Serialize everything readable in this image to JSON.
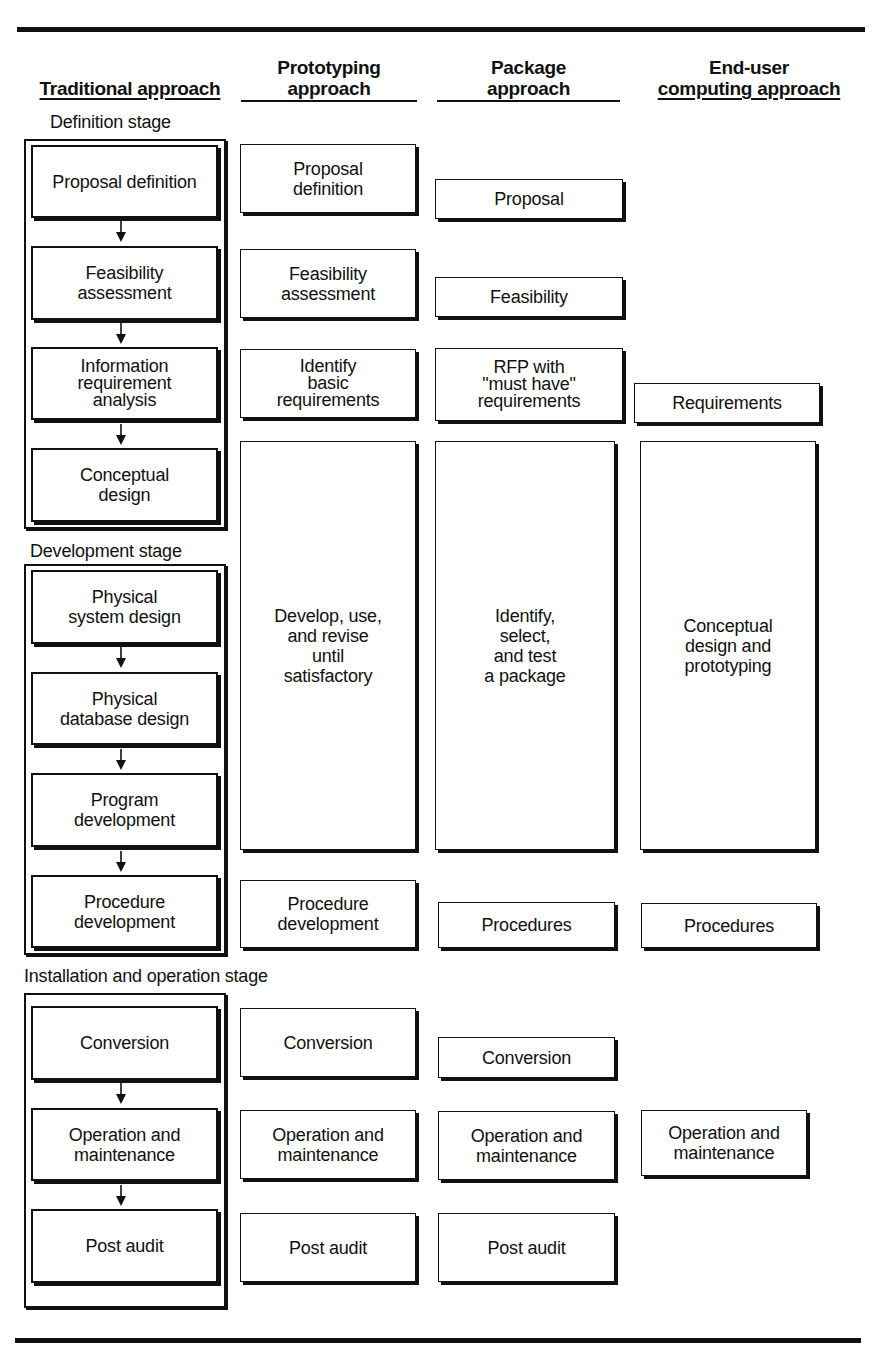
{
  "headers": {
    "traditional": {
      "line1": "",
      "line2": "Traditional approach"
    },
    "prototyping": {
      "line1": "Prototyping",
      "line2": "approach"
    },
    "package": {
      "line1": "Package",
      "line2": "approach"
    },
    "end_user": {
      "line1": "End-user",
      "line2": "computing approach"
    }
  },
  "stages": {
    "definition": "Definition stage",
    "development": "Development stage",
    "installation": "Installation and operation stage"
  },
  "traditional": [
    "Proposal definition",
    "Feasibility\nassessment",
    "Information\nrequirement\nanalysis",
    "Conceptual\ndesign",
    "Physical\nsystem design",
    "Physical\ndatabase design",
    "Program\ndevelopment",
    "Procedure\ndevelopment",
    "Conversion",
    "Operation and\nmaintenance",
    "Post audit"
  ],
  "prototyping": [
    "Proposal\ndefinition",
    "Feasibility\nassessment",
    "Identify\nbasic\nrequirements",
    "Develop, use,\nand revise\nuntil\nsatisfactory",
    "Procedure\ndevelopment",
    "Conversion",
    "Operation and\nmaintenance",
    "Post audit"
  ],
  "package": [
    "Proposal",
    "Feasibility",
    "RFP with\n\"must have\"\nrequirements",
    "Identify,\nselect,\nand test\na package",
    "Procedures",
    "Conversion",
    "Operation and\nmaintenance",
    "Post audit"
  ],
  "end_user": [
    "Requirements",
    "Conceptual\ndesign and\nprototyping",
    "Procedures",
    "Operation and\nmaintenance"
  ]
}
